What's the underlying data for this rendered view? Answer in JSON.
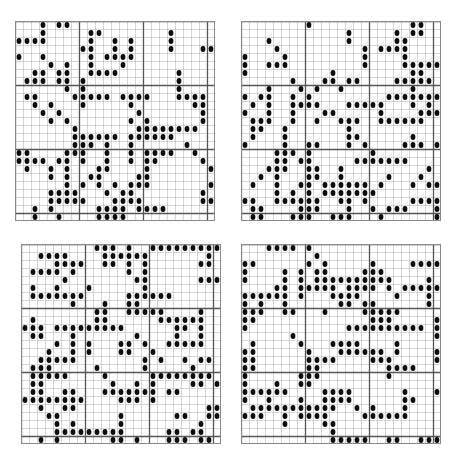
{
  "figure": {
    "title": "",
    "background_color": "#ffffff",
    "panel_count": 4,
    "layout": "2x2"
  },
  "style": {
    "dot_color": "#0d0d0d",
    "minor_grid_color": "#b9b9b9",
    "major_grid_color": "#555555",
    "border_color": "#8a8a8a",
    "background_color": "#ffffff",
    "minor_grid_width": 0.6,
    "major_grid_width": 1.3,
    "dot_radius_ratio": 0.3,
    "dot_aspect": 1.25
  },
  "chart_data": {
    "type": "scatter",
    "title": "",
    "subtitle": "",
    "xlabel": "",
    "ylabel": "",
    "grid": true,
    "legend_position": "none",
    "panels": [
      {
        "id": "panel-tl",
        "name": "top-left",
        "position": "top-left",
        "cols": 25,
        "rows": 25,
        "cell_px": 8,
        "width_px": 200,
        "height_px": 200,
        "major_every": 8,
        "xlim": [
          0,
          25
        ],
        "ylim": [
          0,
          25
        ],
        "fill_fraction": 0.3,
        "seed": 20412,
        "dot_count": 188
      },
      {
        "id": "panel-tr",
        "name": "top-right",
        "position": "top-right",
        "cols": 25,
        "rows": 25,
        "cell_px": 8,
        "width_px": 200,
        "height_px": 200,
        "major_every": 8,
        "xlim": [
          0,
          25
        ],
        "ylim": [
          0,
          25
        ],
        "fill_fraction": 0.33,
        "seed": 77311,
        "dot_count": 206
      },
      {
        "id": "panel-bl",
        "name": "bottom-left",
        "position": "bottom-left",
        "cols": 25,
        "rows": 25,
        "cell_px": 8,
        "width_px": 200,
        "height_px": 200,
        "major_every": 8,
        "xlim": [
          0,
          25
        ],
        "ylim": [
          0,
          25
        ],
        "fill_fraction": 0.36,
        "seed": 51187,
        "dot_count": 225
      },
      {
        "id": "panel-br",
        "name": "bottom-right",
        "position": "bottom-right",
        "cols": 25,
        "rows": 25,
        "cell_px": 8,
        "width_px": 200,
        "height_px": 200,
        "major_every": 8,
        "xlim": [
          0,
          25
        ],
        "ylim": [
          0,
          25
        ],
        "fill_fraction": 0.34,
        "seed": 33920,
        "dot_count": 213
      }
    ]
  }
}
